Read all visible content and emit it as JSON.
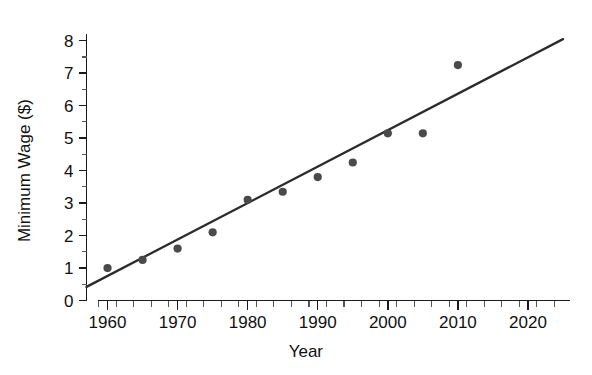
{
  "chart_data": {
    "type": "scatter",
    "title": "",
    "xlabel": "Year",
    "ylabel": "Minimum Wage ($)",
    "x": [
      1960,
      1965,
      1970,
      1975,
      1980,
      1985,
      1990,
      1995,
      2000,
      2005,
      2010
    ],
    "values": [
      1.0,
      1.25,
      1.6,
      2.1,
      3.1,
      3.35,
      3.8,
      4.25,
      5.15,
      5.15,
      7.25
    ],
    "series": [
      {
        "name": "Minimum Wage",
        "values": [
          1.0,
          1.25,
          1.6,
          2.1,
          3.1,
          3.35,
          3.8,
          4.25,
          5.15,
          5.15,
          7.25
        ]
      }
    ],
    "trendline": {
      "type": "linear",
      "x_start": 1957,
      "y_start": 0.42,
      "x_end": 2025,
      "y_end": 8.05
    },
    "xlim": [
      1957,
      2026
    ],
    "ylim": [
      0,
      8.3
    ],
    "xticks": [
      1960,
      1970,
      1980,
      1990,
      2000,
      2010,
      2020
    ],
    "xtick_labels": [
      "1960",
      "1970",
      "1980",
      "1990",
      "2000",
      "2010",
      "2020"
    ],
    "xtick_minor_step": 2.5,
    "yticks": [
      0,
      1,
      2,
      3,
      4,
      5,
      6,
      7,
      8
    ],
    "ytick_labels": [
      "0",
      "1",
      "2",
      "3",
      "4",
      "5",
      "6",
      "7",
      "8"
    ],
    "ytick_minor_step": 0.5,
    "grid": false,
    "legend": "none",
    "marker_color": "#4a4a4a",
    "line_color": "#2b2b2b",
    "axis_color": "#1a1a1a",
    "background": "#ffffff"
  }
}
